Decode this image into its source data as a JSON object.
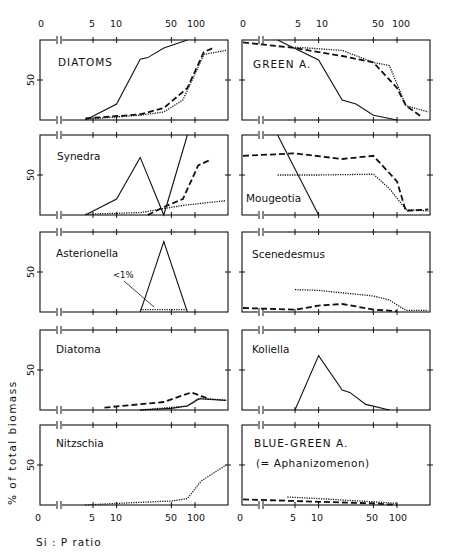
{
  "chart_data": {
    "type": "line",
    "title": "",
    "xlabel": "Si : P ratio",
    "ylabel": "% of total biomass",
    "x_scale": "log (with break between 0 and 5)",
    "x_tick_labels": [
      "0",
      "5",
      "10",
      "50",
      "100"
    ],
    "y_tick_labels": [
      "50"
    ],
    "ylim": [
      0,
      100
    ],
    "series_styles": [
      "solid",
      "dashed",
      "dotted"
    ],
    "panels": [
      {
        "name": "DIATOMS",
        "column": "left",
        "row": 1,
        "series": [
          {
            "style": "solid",
            "points": [
              [
                4,
                0
              ],
              [
                10,
                20
              ],
              [
                20,
                76
              ],
              [
                25,
                78
              ],
              [
                40,
                90
              ],
              [
                80,
                100
              ]
            ]
          },
          {
            "style": "dashed",
            "points": [
              [
                4,
                2
              ],
              [
                20,
                7
              ],
              [
                40,
                15
              ],
              [
                80,
                40
              ],
              [
                130,
                85
              ],
              [
                180,
                91
              ]
            ]
          },
          {
            "style": "dotted",
            "points": [
              [
                4,
                1
              ],
              [
                20,
                6
              ],
              [
                40,
                10
              ],
              [
                70,
                25
              ],
              [
                130,
                82
              ],
              [
                250,
                87
              ]
            ]
          }
        ]
      },
      {
        "name": "GREEN A.",
        "column": "right",
        "row": 1,
        "series": [
          {
            "style": "solid",
            "points": [
              [
                3,
                100
              ],
              [
                10,
                75
              ],
              [
                20,
                25
              ],
              [
                30,
                20
              ],
              [
                50,
                6
              ],
              [
                100,
                0
              ]
            ]
          },
          {
            "style": "dashed",
            "points": [
              [
                0,
                97
              ],
              [
                5,
                90
              ],
              [
                20,
                80
              ],
              [
                50,
                72
              ],
              [
                100,
                40
              ],
              [
                130,
                18
              ],
              [
                200,
                5
              ]
            ]
          },
          {
            "style": "dotted",
            "points": [
              [
                5,
                91
              ],
              [
                20,
                87
              ],
              [
                50,
                72
              ],
              [
                80,
                68
              ],
              [
                130,
                18
              ],
              [
                250,
                10
              ]
            ]
          }
        ]
      },
      {
        "name": "Synedra",
        "column": "left",
        "row": 2,
        "series": [
          {
            "style": "solid",
            "points": [
              [
                4,
                0
              ],
              [
                10,
                20
              ],
              [
                20,
                72
              ],
              [
                40,
                0
              ],
              [
                80,
                100
              ]
            ]
          },
          {
            "style": "dashed",
            "points": [
              [
                25,
                0
              ],
              [
                40,
                10
              ],
              [
                70,
                20
              ],
              [
                110,
                62
              ],
              [
                150,
                68
              ]
            ]
          },
          {
            "style": "dotted",
            "points": [
              [
                4,
                1
              ],
              [
                20,
                3
              ],
              [
                40,
                8
              ],
              [
                70,
                12
              ],
              [
                250,
                18
              ]
            ]
          }
        ]
      },
      {
        "name": "Mougeotia",
        "column": "right",
        "row": 2,
        "series": [
          {
            "style": "solid",
            "points": [
              [
                3,
                100
              ],
              [
                10,
                0
              ]
            ]
          },
          {
            "style": "dashed",
            "points": [
              [
                0,
                74
              ],
              [
                5,
                77
              ],
              [
                20,
                70
              ],
              [
                50,
                74
              ],
              [
                100,
                42
              ],
              [
                130,
                5
              ],
              [
                250,
                7
              ]
            ]
          },
          {
            "style": "dotted",
            "points": [
              [
                3,
                50
              ],
              [
                10,
                50
              ],
              [
                50,
                51
              ],
              [
                80,
                33
              ],
              [
                130,
                7
              ],
              [
                250,
                5
              ]
            ]
          }
        ]
      },
      {
        "name": "Asterionella",
        "column": "left",
        "row": 3,
        "annotation": "<1%",
        "series": [
          {
            "style": "solid",
            "points": [
              [
                20,
                0
              ],
              [
                25,
                28
              ],
              [
                40,
                88
              ],
              [
                80,
                0
              ]
            ]
          },
          {
            "style": "dotted",
            "points": [
              [
                20,
                3
              ],
              [
                80,
                3
              ]
            ]
          }
        ]
      },
      {
        "name": "Scenedesmus",
        "column": "right",
        "row": 3,
        "series": [
          {
            "style": "dashed",
            "points": [
              [
                0,
                5
              ],
              [
                5,
                3
              ],
              [
                10,
                8
              ],
              [
                20,
                10
              ],
              [
                30,
                7
              ],
              [
                50,
                3
              ],
              [
                100,
                1
              ]
            ]
          },
          {
            "style": "dotted",
            "points": [
              [
                5,
                28
              ],
              [
                10,
                27
              ],
              [
                50,
                20
              ],
              [
                80,
                15
              ],
              [
                130,
                2
              ],
              [
                250,
                2
              ]
            ]
          }
        ]
      },
      {
        "name": "Diatoma",
        "column": "left",
        "row": 4,
        "series": [
          {
            "style": "solid",
            "points": [
              [
                20,
                0
              ],
              [
                50,
                2
              ],
              [
                80,
                5
              ],
              [
                110,
                14
              ],
              [
                250,
                12
              ]
            ]
          },
          {
            "style": "dashed",
            "points": [
              [
                7,
                3
              ],
              [
                40,
                10
              ],
              [
                90,
                22
              ],
              [
                150,
                14
              ]
            ]
          },
          {
            "style": "dotted",
            "points": [
              [
                20,
                0
              ],
              [
                80,
                5
              ],
              [
                120,
                15
              ],
              [
                250,
                12
              ]
            ]
          }
        ]
      },
      {
        "name": "Koliella",
        "column": "right",
        "row": 4,
        "series": [
          {
            "style": "solid",
            "points": [
              [
                5,
                0
              ],
              [
                10,
                68
              ],
              [
                20,
                25
              ],
              [
                25,
                22
              ],
              [
                40,
                7
              ],
              [
                80,
                0
              ]
            ]
          }
        ]
      },
      {
        "name": "Nitzschia",
        "column": "left",
        "row": 5,
        "series": [
          {
            "style": "dotted",
            "points": [
              [
                4,
                0
              ],
              [
                10,
                2
              ],
              [
                50,
                5
              ],
              [
                80,
                8
              ],
              [
                120,
                30
              ],
              [
                250,
                50
              ]
            ]
          }
        ]
      },
      {
        "name": "BLUE-GREEN A.",
        "subtitle": "(= Aphanizomenon)",
        "column": "right",
        "row": 5,
        "series": [
          {
            "style": "dashed",
            "points": [
              [
                0,
                7
              ],
              [
                5,
                5
              ],
              [
                10,
                4
              ],
              [
                50,
                2
              ],
              [
                100,
                0
              ]
            ]
          },
          {
            "style": "dotted",
            "points": [
              [
                4,
                10
              ],
              [
                10,
                8
              ],
              [
                50,
                4
              ],
              [
                100,
                2
              ]
            ]
          }
        ]
      }
    ]
  },
  "axes": {
    "top_ticks": [
      "0",
      "5",
      "10",
      "50",
      "100"
    ],
    "bottom_ticks": [
      "0",
      "5",
      "10",
      "50",
      "100"
    ],
    "y_tick": "50",
    "y_label": "% of total biomass",
    "x_label": "Si : P   ratio"
  },
  "panels": {
    "diatoms": "DIATOMS",
    "green": "GREEN A.",
    "synedra": "Synedra",
    "mougeotia": "Mougeotia",
    "asterionella": "Asterionella",
    "asterionella_note": "<1%",
    "scenedesmus": "Scenedesmus",
    "diatoma": "Diatoma",
    "koliella": "Koliella",
    "nitzschia": "Nitzschia",
    "bluegreen": "BLUE-GREEN A.",
    "bluegreen_sub": "(= Aphanizomenon)"
  }
}
